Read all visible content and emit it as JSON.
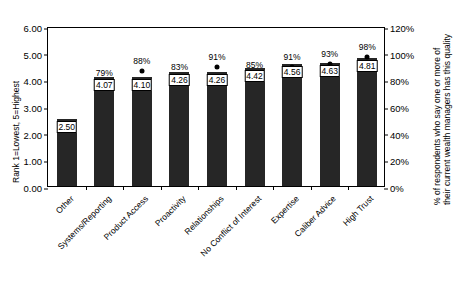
{
  "chart_data": {
    "type": "bar",
    "title": "",
    "subtitle": "",
    "categories": [
      "Other",
      "Systems/Reporting",
      "Product Access",
      "Proactivity",
      "Relationships",
      "No Conflict of Interest",
      "Expertise",
      "Caliber Advice",
      "High Trust"
    ],
    "series": [
      {
        "name": "Rank",
        "type": "bar",
        "axis": "left",
        "values": [
          2.5,
          4.07,
          4.1,
          4.26,
          4.26,
          4.42,
          4.56,
          4.63,
          4.81
        ],
        "value_labels": [
          "2.50",
          "4.07",
          "4.10",
          "4.26",
          "4.26",
          "4.42",
          "4.56",
          "4.63",
          "4.81"
        ]
      },
      {
        "name": "% of respondents",
        "type": "scatter",
        "axis": "right",
        "values": [
          null,
          79,
          88,
          83,
          91,
          85,
          91,
          93,
          98
        ],
        "value_labels": [
          "",
          "79%",
          "88%",
          "83%",
          "91%",
          "85%",
          "91%",
          "93%",
          "98%"
        ]
      }
    ],
    "xlabel": "",
    "ylabel": "Rank 1=Lowest, 5=Highest",
    "ylabel_right_lines": [
      "% of respondents who say one or more of",
      "their current wealth managers has this quality"
    ],
    "ylim": [
      0,
      6
    ],
    "yticks": [
      "0.00",
      "1.00",
      "2.00",
      "3.00",
      "4.00",
      "5.00",
      "6.00"
    ],
    "ytick_values": [
      0,
      1,
      2,
      3,
      4,
      5,
      6
    ],
    "ylim_right": [
      0,
      120
    ],
    "yticks_right": [
      "0%",
      "20%",
      "40%",
      "60%",
      "80%",
      "100%",
      "120%"
    ],
    "ytick_right_values": [
      0,
      20,
      40,
      60,
      80,
      100,
      120
    ],
    "grid": false,
    "legend": "none",
    "colors": {
      "bar": "#262626",
      "dot": "#000000",
      "axis": "#000000",
      "background": "#ffffff",
      "label_box_fill": "#ffffff"
    }
  }
}
